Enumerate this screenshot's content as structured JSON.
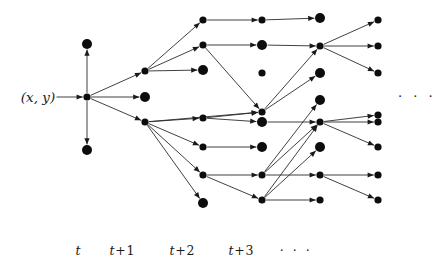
{
  "figure": {
    "type": "tree-diagram",
    "title": "",
    "width": 439,
    "height": 269,
    "background_color": "#ffffff",
    "node_color": "#0d0d0d",
    "edge_color": "#2b2b2b"
  },
  "root": {
    "label": "(x, y)",
    "x": 38,
    "y": 97
  },
  "right_ellipsis": {
    "text": "· · ·",
    "x": 417,
    "y": 96
  },
  "axis": {
    "label_y": 243,
    "labels": [
      {
        "name": "t",
        "base": "t",
        "op": "",
        "num": "",
        "x": 78
      },
      {
        "name": "t-plus-1",
        "base": "t",
        "op": "+",
        "num": "1",
        "x": 122
      },
      {
        "name": "t-plus-2",
        "base": "t",
        "op": "+",
        "num": "2",
        "x": 182
      },
      {
        "name": "t-plus-3",
        "base": "t",
        "op": "+",
        "num": "3",
        "x": 241
      },
      {
        "name": "ellipsis",
        "base": "",
        "op": "",
        "num": "· · ·",
        "x": 296
      }
    ]
  },
  "columns": [
    {
      "name": "t",
      "x": 87
    },
    {
      "name": "t+1",
      "x": 145
    },
    {
      "name": "t+2",
      "x": 203
    },
    {
      "name": "t+3",
      "x": 262
    },
    {
      "name": "t+4",
      "x": 320
    },
    {
      "name": "t+5",
      "x": 378
    }
  ],
  "nodes": [
    {
      "id": "r",
      "x": 87,
      "y": 97,
      "r": 3.6,
      "terminal": false
    },
    {
      "id": "a0",
      "x": 87,
      "y": 44,
      "r": 5.0,
      "terminal": true
    },
    {
      "id": "a1",
      "x": 145,
      "y": 71,
      "r": 3.6,
      "terminal": false
    },
    {
      "id": "a2",
      "x": 145,
      "y": 97,
      "r": 5.0,
      "terminal": true
    },
    {
      "id": "a3",
      "x": 145,
      "y": 122,
      "r": 3.6,
      "terminal": false
    },
    {
      "id": "a4",
      "x": 87,
      "y": 150,
      "r": 5.0,
      "terminal": true
    },
    {
      "id": "b0",
      "x": 203,
      "y": 20,
      "r": 3.6,
      "terminal": false
    },
    {
      "id": "b1",
      "x": 203,
      "y": 45,
      "r": 3.6,
      "terminal": false
    },
    {
      "id": "b2",
      "x": 203,
      "y": 70,
      "r": 5.0,
      "terminal": true
    },
    {
      "id": "b3",
      "x": 203,
      "y": 118,
      "r": 3.6,
      "terminal": false
    },
    {
      "id": "b4",
      "x": 203,
      "y": 147,
      "r": 3.6,
      "terminal": false
    },
    {
      "id": "b5",
      "x": 203,
      "y": 175,
      "r": 3.6,
      "terminal": false
    },
    {
      "id": "b6",
      "x": 203,
      "y": 203,
      "r": 5.0,
      "terminal": true
    },
    {
      "id": "c0",
      "x": 262,
      "y": 20,
      "r": 3.6,
      "terminal": false
    },
    {
      "id": "c1",
      "x": 262,
      "y": 45,
      "r": 5.0,
      "terminal": true
    },
    {
      "id": "c2",
      "x": 262,
      "y": 73,
      "r": 3.6,
      "terminal": false
    },
    {
      "id": "c3",
      "x": 262,
      "y": 112,
      "r": 3.6,
      "terminal": false
    },
    {
      "id": "c4",
      "x": 262,
      "y": 122,
      "r": 5.0,
      "terminal": true
    },
    {
      "id": "c5",
      "x": 262,
      "y": 147,
      "r": 5.0,
      "terminal": true
    },
    {
      "id": "c6",
      "x": 262,
      "y": 175,
      "r": 3.6,
      "terminal": false
    },
    {
      "id": "c7",
      "x": 262,
      "y": 200,
      "r": 3.6,
      "terminal": false
    },
    {
      "id": "d0",
      "x": 320,
      "y": 18,
      "r": 5.0,
      "terminal": true
    },
    {
      "id": "d1",
      "x": 320,
      "y": 46,
      "r": 3.6,
      "terminal": false
    },
    {
      "id": "d2",
      "x": 320,
      "y": 73,
      "r": 5.0,
      "terminal": true
    },
    {
      "id": "d3",
      "x": 320,
      "y": 100,
      "r": 5.0,
      "terminal": true
    },
    {
      "id": "d4",
      "x": 320,
      "y": 122,
      "r": 3.6,
      "terminal": false
    },
    {
      "id": "d5",
      "x": 320,
      "y": 147,
      "r": 5.0,
      "terminal": true
    },
    {
      "id": "d6",
      "x": 320,
      "y": 175,
      "r": 3.6,
      "terminal": false
    },
    {
      "id": "d7",
      "x": 320,
      "y": 200,
      "r": 3.6,
      "terminal": false
    },
    {
      "id": "e0",
      "x": 378,
      "y": 20,
      "r": 3.6,
      "terminal": false
    },
    {
      "id": "e1",
      "x": 378,
      "y": 46,
      "r": 3.6,
      "terminal": false
    },
    {
      "id": "e2",
      "x": 378,
      "y": 73,
      "r": 3.6,
      "terminal": false
    },
    {
      "id": "e3",
      "x": 378,
      "y": 115,
      "r": 3.6,
      "terminal": false
    },
    {
      "id": "e4",
      "x": 378,
      "y": 122,
      "r": 3.6,
      "terminal": false
    },
    {
      "id": "e5",
      "x": 378,
      "y": 147,
      "r": 3.6,
      "terminal": false
    },
    {
      "id": "e6",
      "x": 378,
      "y": 175,
      "r": 3.6,
      "terminal": false
    },
    {
      "id": "e7",
      "x": 378,
      "y": 200,
      "r": 3.6,
      "terminal": false
    }
  ],
  "edges": [
    {
      "from": "root-label",
      "to": "r"
    },
    {
      "from": "r",
      "to": "a0"
    },
    {
      "from": "r",
      "to": "a1"
    },
    {
      "from": "r",
      "to": "a2"
    },
    {
      "from": "r",
      "to": "a3"
    },
    {
      "from": "r",
      "to": "a4"
    },
    {
      "from": "a1",
      "to": "b0"
    },
    {
      "from": "a1",
      "to": "b1"
    },
    {
      "from": "a1",
      "to": "b2"
    },
    {
      "from": "a3",
      "to": "b3"
    },
    {
      "from": "a3",
      "to": "b4"
    },
    {
      "from": "a3",
      "to": "b5"
    },
    {
      "from": "a3",
      "to": "b6"
    },
    {
      "from": "a3",
      "to": "c3"
    },
    {
      "from": "b0",
      "to": "c0"
    },
    {
      "from": "b1",
      "to": "c1"
    },
    {
      "from": "b1",
      "to": "c3"
    },
    {
      "from": "b3",
      "to": "c3"
    },
    {
      "from": "b3",
      "to": "c4"
    },
    {
      "from": "b4",
      "to": "c5"
    },
    {
      "from": "b5",
      "to": "c6"
    },
    {
      "from": "b5",
      "to": "c7"
    },
    {
      "from": "c0",
      "to": "d0"
    },
    {
      "from": "c3",
      "to": "d1"
    },
    {
      "from": "c1",
      "to": "d1"
    },
    {
      "from": "c3",
      "to": "d2"
    },
    {
      "from": "c6",
      "to": "d3"
    },
    {
      "from": "c6",
      "to": "d4"
    },
    {
      "from": "c7",
      "to": "d4"
    },
    {
      "from": "c7",
      "to": "d5"
    },
    {
      "from": "c4",
      "to": "d4"
    },
    {
      "from": "c6",
      "to": "d6"
    },
    {
      "from": "c7",
      "to": "d7"
    },
    {
      "from": "d1",
      "to": "e0"
    },
    {
      "from": "d1",
      "to": "e1"
    },
    {
      "from": "d1",
      "to": "e2"
    },
    {
      "from": "d4",
      "to": "e3"
    },
    {
      "from": "d4",
      "to": "e4"
    },
    {
      "from": "d4",
      "to": "e5"
    },
    {
      "from": "d6",
      "to": "e6"
    },
    {
      "from": "d6",
      "to": "e7"
    }
  ]
}
